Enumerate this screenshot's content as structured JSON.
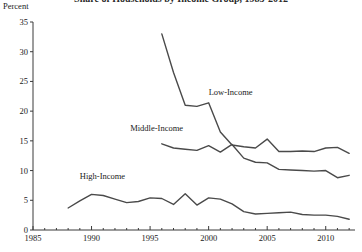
{
  "chart_data": {
    "type": "line",
    "title": "Share of Households by Income Group, 1985-2012",
    "title_visible_fragment": "y Income Group, 1985-2012",
    "ylabel": "Percent",
    "xlabel": "",
    "ylim": [
      0,
      35
    ],
    "xlim": [
      1985,
      2012.5
    ],
    "yticks": [
      0,
      5,
      10,
      15,
      20,
      25,
      30,
      35
    ],
    "ytick_labels": [
      "0",
      "5",
      "10",
      "15",
      "20",
      "25",
      "30",
      "35"
    ],
    "xticks": [
      1985,
      1990,
      1995,
      2000,
      2005,
      2010
    ],
    "xtick_labels": [
      "1985",
      "1990",
      "1995",
      "2000",
      "2005",
      "2010"
    ],
    "grid": false,
    "legend_position": "inline-annotations",
    "line_color": "#4a4a4a",
    "series": [
      {
        "name": "Low-Income",
        "label": "Low-Income",
        "label_x": 2000.0,
        "label_y": 23.0,
        "x": [
          1996,
          1997,
          1998,
          1999,
          2000,
          2001,
          2002,
          2003,
          2004,
          2005,
          2006,
          2007,
          2008,
          2009,
          2010,
          2011,
          2012
        ],
        "values": [
          33.0,
          26.5,
          21.0,
          20.8,
          21.4,
          16.5,
          14.3,
          14.0,
          13.8,
          15.3,
          13.2,
          13.2,
          13.3,
          13.2,
          13.8,
          13.9,
          12.9
        ]
      },
      {
        "name": "Middle-Income",
        "label": "Middle-Income",
        "label_x": 1993.3,
        "label_y": 17.0,
        "x": [
          1996,
          1997,
          1998,
          1999,
          2000,
          2001,
          2002,
          2003,
          2004,
          2005,
          2006,
          2007,
          2008,
          2009,
          2010,
          2011,
          2012
        ],
        "values": [
          14.5,
          13.8,
          13.6,
          13.4,
          14.2,
          13.1,
          14.4,
          12.1,
          11.4,
          11.3,
          10.2,
          10.1,
          10.0,
          9.9,
          10.0,
          8.8,
          9.2
        ]
      },
      {
        "name": "High-Income",
        "label": "High-Income",
        "label_x": 1989.0,
        "label_y": 9.0,
        "x": [
          1988,
          1989,
          1990,
          1991,
          1992,
          1993,
          1994,
          1995,
          1996,
          1997,
          1998,
          1999,
          2000,
          2001,
          2002,
          2003,
          2004,
          2005,
          2006,
          2007,
          2008,
          2009,
          2010,
          2011,
          2012
        ],
        "values": [
          3.7,
          4.9,
          6.0,
          5.8,
          5.2,
          4.6,
          4.8,
          5.4,
          5.3,
          4.3,
          6.1,
          4.2,
          5.4,
          5.2,
          4.4,
          3.1,
          2.7,
          2.8,
          2.9,
          3.0,
          2.6,
          2.5,
          2.5,
          2.3,
          1.8
        ]
      }
    ]
  }
}
